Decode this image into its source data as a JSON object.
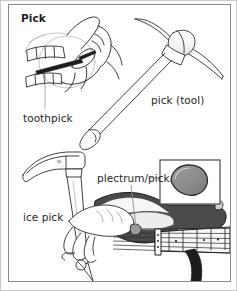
{
  "page": {
    "title": "Pick",
    "kind": "illustrated-dictionary-entry",
    "width": 237,
    "height": 291,
    "background_color": "#ffffff",
    "outer_border_color": "#c9c9c9",
    "panel_border_color": "#8a8a8a"
  },
  "labels": {
    "toothpick": "toothpick",
    "pick_tool": "pick (tool)",
    "ice_pick": "ice pick",
    "plectrum": "plectrum/pick"
  },
  "illustrations": [
    {
      "name": "toothpick-illustration",
      "description": "line drawing of a hand holding a toothpick between teeth",
      "label": "toothpick",
      "style": "black line art",
      "position": "top-left"
    },
    {
      "name": "pick-tool-illustration",
      "description": "line drawing of a pickaxe with curved double-ended head and long handle",
      "label": "pick (tool)",
      "style": "black line art",
      "position": "top-right"
    },
    {
      "name": "ice-pick-illustration",
      "description": "line drawing of an ice pick with curved head and tapered spike",
      "label": "ice pick",
      "style": "black line art",
      "position": "bottom-left"
    },
    {
      "name": "plectrum-illustration",
      "description": "drawing of a hand strumming an electric guitar with a plectrum, with an inset close-up of the pick",
      "label": "plectrum/pick",
      "style": "shaded line art with dark gray guitar body",
      "position": "bottom-right"
    }
  ],
  "colors": {
    "ink": "#1f1f1f",
    "line": "#2b2b2b",
    "light_line": "#9a9a9a",
    "guitar_body": "#4a4a4a",
    "guitar_body_dark": "#2f2f2f",
    "pick_fill": "#8c8c8c",
    "pick_edge": "#3a3a3a",
    "fretboard": "#f2f2f2",
    "inset_border": "#4a4a4a",
    "paper": "#ffffff"
  }
}
